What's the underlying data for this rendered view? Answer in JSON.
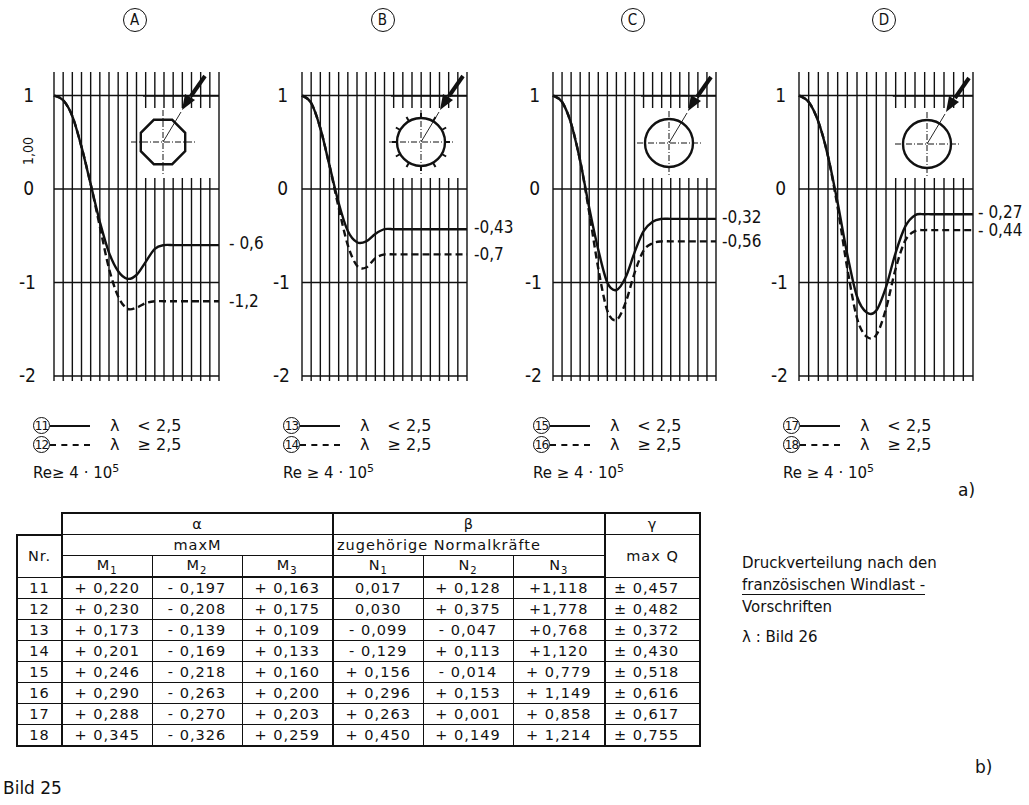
{
  "figure": {
    "label": "Bild 25",
    "part_a": "a)",
    "part_b": "b)"
  },
  "chart_data": [
    {
      "type": "line",
      "panel": "A",
      "shape": "octagon",
      "y_ticks": [
        "1",
        "0",
        "-1",
        "-2"
      ],
      "ylim": [
        -2,
        1
      ],
      "y_axis_annotation": "1,00",
      "grid": true,
      "x": [
        0,
        10,
        20,
        30,
        40,
        50,
        60,
        70,
        80,
        90,
        100,
        110,
        120,
        130,
        140,
        150,
        160,
        170,
        180
      ],
      "series": [
        {
          "name": "11",
          "style": "solid",
          "end_label": "- 0,6",
          "values": [
            1.0,
            0.95,
            0.78,
            0.45,
            0.05,
            -0.35,
            -0.68,
            -0.88,
            -0.96,
            -0.92,
            -0.78,
            -0.64,
            -0.6,
            -0.6,
            -0.6,
            -0.6,
            -0.6,
            -0.6,
            -0.6
          ]
        },
        {
          "name": "12",
          "style": "dashed",
          "end_label": "-1,2",
          "values": [
            1.0,
            0.95,
            0.78,
            0.45,
            0.05,
            -0.4,
            -0.85,
            -1.15,
            -1.28,
            -1.27,
            -1.22,
            -1.2,
            -1.2,
            -1.2,
            -1.2,
            -1.2,
            -1.2,
            -1.2,
            -1.2
          ]
        }
      ]
    },
    {
      "type": "line",
      "panel": "B",
      "shape": "circle with ribs",
      "y_ticks": [
        "1",
        "0",
        "-1",
        "-2"
      ],
      "ylim": [
        -2,
        1
      ],
      "grid": true,
      "x": [
        0,
        10,
        20,
        30,
        40,
        50,
        60,
        70,
        80,
        90,
        100,
        110,
        120,
        130,
        140,
        150,
        160,
        170,
        180
      ],
      "series": [
        {
          "name": "13",
          "style": "solid",
          "end_label": "-0,43",
          "values": [
            1.0,
            0.92,
            0.65,
            0.25,
            -0.15,
            -0.45,
            -0.57,
            -0.56,
            -0.48,
            -0.43,
            -0.43,
            -0.43,
            -0.43,
            -0.43,
            -0.43,
            -0.43,
            -0.43,
            -0.43,
            -0.43
          ]
        },
        {
          "name": "14",
          "style": "dashed",
          "end_label": "-0,7",
          "values": [
            1.0,
            0.92,
            0.65,
            0.25,
            -0.2,
            -0.6,
            -0.82,
            -0.84,
            -0.74,
            -0.7,
            -0.7,
            -0.7,
            -0.7,
            -0.7,
            -0.7,
            -0.7,
            -0.7,
            -0.7,
            -0.7
          ]
        }
      ]
    },
    {
      "type": "line",
      "panel": "C",
      "shape": "circle (smooth)",
      "y_ticks": [
        "1",
        "0",
        "-1",
        "-2"
      ],
      "ylim": [
        -2,
        1
      ],
      "grid": true,
      "x": [
        0,
        10,
        20,
        30,
        40,
        50,
        60,
        70,
        80,
        90,
        100,
        110,
        120,
        130,
        140,
        150,
        160,
        170,
        180
      ],
      "series": [
        {
          "name": "15",
          "style": "solid",
          "end_label": "-0,32",
          "values": [
            1.0,
            0.93,
            0.7,
            0.3,
            -0.2,
            -0.65,
            -1.0,
            -1.08,
            -0.95,
            -0.68,
            -0.45,
            -0.35,
            -0.32,
            -0.32,
            -0.32,
            -0.32,
            -0.32,
            -0.32,
            -0.32
          ]
        },
        {
          "name": "16",
          "style": "dashed",
          "end_label": "-0,56",
          "values": [
            1.0,
            0.93,
            0.7,
            0.3,
            -0.25,
            -0.85,
            -1.3,
            -1.4,
            -1.22,
            -0.9,
            -0.66,
            -0.58,
            -0.56,
            -0.56,
            -0.56,
            -0.56,
            -0.56,
            -0.56,
            -0.56
          ]
        }
      ]
    },
    {
      "type": "line",
      "panel": "D",
      "shape": "circle (very smooth)",
      "y_ticks": [
        "1",
        "0",
        "-1",
        "-2"
      ],
      "ylim": [
        -2,
        1
      ],
      "grid": true,
      "x": [
        0,
        10,
        20,
        30,
        40,
        50,
        60,
        70,
        80,
        90,
        100,
        110,
        120,
        130,
        140,
        150,
        160,
        170,
        180
      ],
      "series": [
        {
          "name": "17",
          "style": "solid",
          "end_label": "- 0,27",
          "values": [
            1.0,
            0.93,
            0.72,
            0.35,
            -0.15,
            -0.7,
            -1.15,
            -1.32,
            -1.3,
            -1.05,
            -0.68,
            -0.4,
            -0.28,
            -0.27,
            -0.27,
            -0.27,
            -0.27,
            -0.27,
            -0.27
          ]
        },
        {
          "name": "18",
          "style": "dashed",
          "end_label": "- 0,44",
          "values": [
            1.0,
            0.93,
            0.72,
            0.35,
            -0.2,
            -0.85,
            -1.38,
            -1.58,
            -1.56,
            -1.28,
            -0.85,
            -0.55,
            -0.45,
            -0.44,
            -0.44,
            -0.44,
            -0.44,
            -0.44,
            -0.44
          ]
        }
      ]
    }
  ],
  "panels": [
    {
      "id": "A",
      "label": "A",
      "end_solid": "- 0,6",
      "end_dashed": "-1,2",
      "y_annot": "1,00",
      "legend": [
        {
          "num": "11",
          "lam": "λ",
          "op": "<",
          "val": "2,5"
        },
        {
          "num": "12",
          "lam": "λ",
          "op": "≥",
          "val": "2,5"
        }
      ],
      "re": "Re≥ 4 · 10",
      "re_exp": "5"
    },
    {
      "id": "B",
      "label": "B",
      "end_solid": "-0,43",
      "end_dashed": "-0,7",
      "legend": [
        {
          "num": "13",
          "lam": "λ",
          "op": "<",
          "val": "2,5"
        },
        {
          "num": "14",
          "lam": "λ",
          "op": "≥",
          "val": "2,5"
        }
      ],
      "re": "Re ≥ 4 · 10",
      "re_exp": "5"
    },
    {
      "id": "C",
      "label": "C",
      "end_solid": "-0,32",
      "end_dashed": "-0,56",
      "legend": [
        {
          "num": "15",
          "lam": "λ",
          "op": "<",
          "val": "2,5"
        },
        {
          "num": "16",
          "lam": "λ",
          "op": "≥",
          "val": "2,5"
        }
      ],
      "re": "Re ≥ 4 · 10",
      "re_exp": "5"
    },
    {
      "id": "D",
      "label": "D",
      "end_solid": "- 0,27",
      "end_dashed": "- 0,44",
      "legend": [
        {
          "num": "17",
          "lam": "λ",
          "op": "<",
          "val": "2,5"
        },
        {
          "num": "18",
          "lam": "λ",
          "op": "≥",
          "val": "2,5"
        }
      ],
      "re": "Re ≥ 4 · 10",
      "re_exp": "5"
    }
  ],
  "y_tick_labels": {
    "p1": "1",
    "z": "0",
    "m1": "-1",
    "m2": "-2"
  },
  "table": {
    "groups": {
      "alpha": "α",
      "beta": "β",
      "gamma": "γ"
    },
    "subgroups": {
      "maxM": "maxM",
      "normal": "zugehörige Normalkräfte",
      "maxQ": "max Q"
    },
    "nr_header": "Nr.",
    "columns": [
      {
        "base": "M",
        "sub": "1"
      },
      {
        "base": "M",
        "sub": "2"
      },
      {
        "base": "M",
        "sub": "3"
      },
      {
        "base": "N",
        "sub": "1"
      },
      {
        "base": "N",
        "sub": "2"
      },
      {
        "base": "N",
        "sub": "3"
      }
    ],
    "rows": [
      {
        "nr": "11",
        "M1": "+ 0,220",
        "M2": "- 0,197",
        "M3": "+ 0,163",
        "N1": "0,017",
        "N2": "+ 0,128",
        "N3": "+1,118",
        "Q": "± 0,457"
      },
      {
        "nr": "12",
        "M1": "+ 0,230",
        "M2": "- 0,208",
        "M3": "+ 0,175",
        "N1": "0,030",
        "N2": "+ 0,375",
        "N3": "+1,778",
        "Q": "± 0,482"
      },
      {
        "nr": "13",
        "M1": "+ 0,173",
        "M2": "- 0,139",
        "M3": "+ 0,109",
        "N1": "- 0,099",
        "N2": "- 0,047",
        "N3": "+0,768",
        "Q": "± 0,372"
      },
      {
        "nr": "14",
        "M1": "+ 0,201",
        "M2": "- 0,169",
        "M3": "+ 0,133",
        "N1": "- 0,129",
        "N2": "+ 0,113",
        "N3": "+1,120",
        "Q": "± 0,430"
      },
      {
        "nr": "15",
        "M1": "+ 0,246",
        "M2": "- 0,218",
        "M3": "+ 0,160",
        "N1": "+ 0,156",
        "N2": "- 0,014",
        "N3": "+ 0,779",
        "Q": "± 0,518"
      },
      {
        "nr": "16",
        "M1": "+ 0,290",
        "M2": "- 0,263",
        "M3": "+ 0,200",
        "N1": "+ 0,296",
        "N2": "+ 0,153",
        "N3": "+ 1,149",
        "Q": "± 0,616"
      },
      {
        "nr": "17",
        "M1": "+ 0,288",
        "M2": "- 0,270",
        "M3": "+ 0,203",
        "N1": "+ 0,263",
        "N2": "+ 0,001",
        "N3": "+ 0,858",
        "Q": "± 0,617"
      },
      {
        "nr": "18",
        "M1": "+ 0,345",
        "M2": "- 0,326",
        "M3": "+ 0,259",
        "N1": "+ 0,450",
        "N2": "+ 0,149",
        "N3": "+ 1,214",
        "Q": "± 0,755"
      }
    ]
  },
  "caption": {
    "line1": "Druckverteilung nach den",
    "line2": "französischen Windlast -",
    "line3": "Vorschriften",
    "line4": "λ : Bild 26"
  }
}
